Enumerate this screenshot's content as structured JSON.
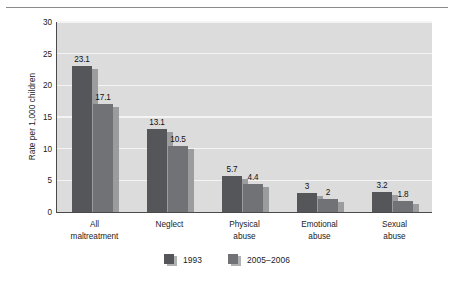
{
  "chart_data": {
    "type": "bar",
    "title": "",
    "xlabel": "",
    "ylabel": "Rate per 1,000 children",
    "ylim": [
      0,
      30
    ],
    "yticks": [
      0,
      5,
      10,
      15,
      20,
      25,
      30
    ],
    "ytick_labels": [
      "0",
      "5",
      "10",
      "15",
      "20",
      "25",
      "30"
    ],
    "grid": true,
    "legend_position": "bottom-center",
    "categories": [
      "All\nmaltreatment",
      "Neglect",
      "Physical\nabuse",
      "Emotional\nabuse",
      "Sexual\nabuse"
    ],
    "series": [
      {
        "name": "1993",
        "color": "#55565a",
        "values": [
          23.1,
          13.1,
          5.7,
          3,
          3.2
        ],
        "value_labels": [
          "23.1",
          "13.1",
          "5.7",
          "3",
          "3.2"
        ]
      },
      {
        "name": "2005–2006",
        "color": "#717276",
        "values": [
          17.1,
          10.5,
          4.4,
          2,
          1.8
        ],
        "value_labels": [
          "17.1",
          "10.5",
          "4.4",
          "2",
          "1.8"
        ]
      }
    ]
  },
  "legend": {
    "items": [
      {
        "label": "1993",
        "color": "#55565a"
      },
      {
        "label": "2005–2006",
        "color": "#717276"
      }
    ]
  },
  "colors": {
    "plot_background": "#dcdcdc",
    "gridline": "#f4f4f4",
    "axis": "#4a4a4a",
    "bar_shadow": "#9b9c9e",
    "series_1993": "#55565a",
    "series_2005_2006": "#717276",
    "text": "#1b1b1b",
    "top_rule": "#8a8a8a"
  }
}
